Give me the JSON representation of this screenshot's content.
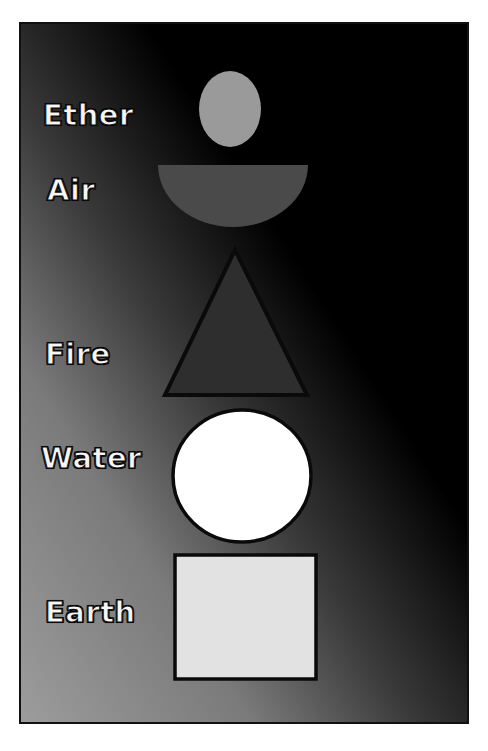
{
  "diagram": {
    "title": "",
    "frame": {
      "gradient_from": "#000000",
      "gradient_to": "#9c9c9c",
      "border_color": "#111111"
    },
    "elements": [
      {
        "label": "Ether",
        "shape": "ellipse",
        "fill": "#9a9a9a",
        "stroke": "none"
      },
      {
        "label": "Air",
        "shape": "half-circle",
        "fill": "#4a4a4a",
        "stroke": "none"
      },
      {
        "label": "Fire",
        "shape": "triangle",
        "fill": "#2e2e2e",
        "stroke": "#0a0a0a"
      },
      {
        "label": "Water",
        "shape": "circle",
        "fill": "#ffffff",
        "stroke": "#0a0a0a"
      },
      {
        "label": "Earth",
        "shape": "square",
        "fill": "#e2e2e2",
        "stroke": "#0a0a0a"
      }
    ]
  }
}
